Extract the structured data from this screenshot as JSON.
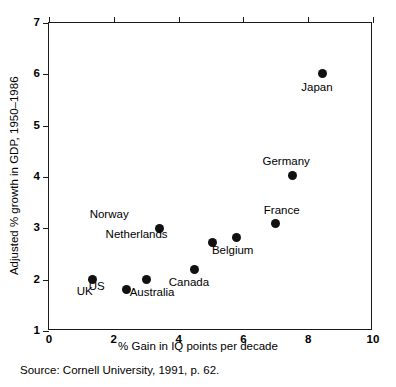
{
  "chart_data": {
    "type": "scatter",
    "title": "",
    "xlabel": "% Gain in IQ points per decade",
    "ylabel": "Adjusted % growth in GDP, 1950–1986",
    "xlim": [
      0,
      10
    ],
    "ylim": [
      1,
      7
    ],
    "xticks": [
      "0",
      "2",
      "4",
      "6",
      "8",
      "10"
    ],
    "yticks": [
      "1",
      "2",
      "3",
      "4",
      "5",
      "6",
      "7"
    ],
    "grid": false,
    "legend": "none",
    "marker_color": "#111111",
    "axis_color": "#1a1a1a",
    "points": [
      {
        "label": "UK",
        "x": 1.35,
        "y": 2.0,
        "label_dx": -8,
        "label_dy": 12
      },
      {
        "label": "US",
        "x": 2.4,
        "y": 1.8,
        "label_dx": -30,
        "label_dy": -3
      },
      {
        "label": "Australia",
        "x": 3.0,
        "y": 2.0,
        "label_dx": 6,
        "label_dy": 13
      },
      {
        "label": "Norway",
        "x": 3.4,
        "y": 3.0,
        "label_dx": -50,
        "label_dy": -13
      },
      {
        "label": "Canada",
        "x": 4.5,
        "y": 2.2,
        "label_dx": -6,
        "label_dy": 14
      },
      {
        "label": "Netherlands",
        "x": 5.05,
        "y": 2.72,
        "label_dx": -76,
        "label_dy": -8
      },
      {
        "label": "Belgium",
        "x": 5.8,
        "y": 2.83,
        "label_dx": -4,
        "label_dy": 14
      },
      {
        "label": "France",
        "x": 7.0,
        "y": 3.1,
        "label_dx": 6,
        "label_dy": -12
      },
      {
        "label": "Germany",
        "x": 7.5,
        "y": 4.02,
        "label_dx": -6,
        "label_dy": -14
      },
      {
        "label": "Japan",
        "x": 8.45,
        "y": 6.01,
        "label_dx": -6,
        "label_dy": 14
      }
    ]
  },
  "source_note": "Source:  Cornell University, 1991, p. 62."
}
